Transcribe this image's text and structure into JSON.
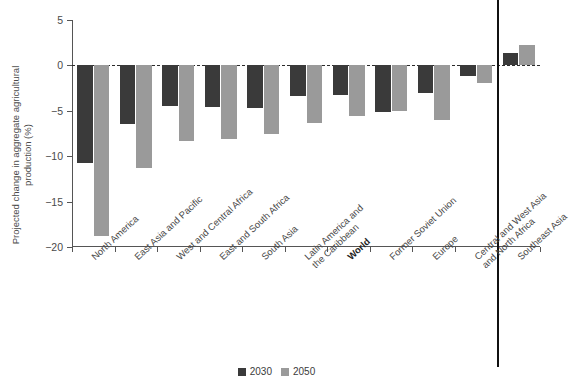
{
  "chart_data": {
    "type": "bar",
    "title": "",
    "xlabel": "",
    "ylabel": "Projected change in aggregate agricultural production (%)",
    "ylim": [
      -20,
      5
    ],
    "yticks": [
      5,
      0,
      -5,
      -10,
      -15,
      -20
    ],
    "ytick_labels": [
      "5",
      "0",
      "−5",
      "−10",
      "−15",
      "−20"
    ],
    "grid": false,
    "zero_line": true,
    "legend_position": "bottom-center",
    "categories": [
      "North America",
      "East Asia and Pacific",
      "West and Central Africa",
      "East and South Africa",
      "South Asia",
      "Latin America and\nthe Caribbean",
      "World",
      "Former Soviet Union",
      "Europe",
      "Central and West Asia\nand North Africa",
      "Southeast Asia"
    ],
    "highlight_category": "World",
    "series": [
      {
        "name": "2030",
        "color": "#3a3a3a",
        "values": [
          -10.7,
          -6.4,
          -4.5,
          -4.6,
          -4.7,
          -3.4,
          -3.3,
          -5.1,
          -3.0,
          -1.2,
          1.4
        ]
      },
      {
        "name": "2050",
        "color": "#9a9a9a",
        "values": [
          -18.8,
          -11.3,
          -8.3,
          -8.1,
          -7.6,
          -6.3,
          -5.6,
          -5.0,
          -6.0,
          -1.9,
          2.3
        ]
      }
    ],
    "annotations": [
      {
        "type": "vertical-separator",
        "after_category": "Central and West Asia and North Africa",
        "color": "#111111"
      }
    ]
  },
  "legend": {
    "items": [
      {
        "label": "2030",
        "color": "#3a3a3a"
      },
      {
        "label": "2050",
        "color": "#9a9a9a"
      }
    ]
  }
}
